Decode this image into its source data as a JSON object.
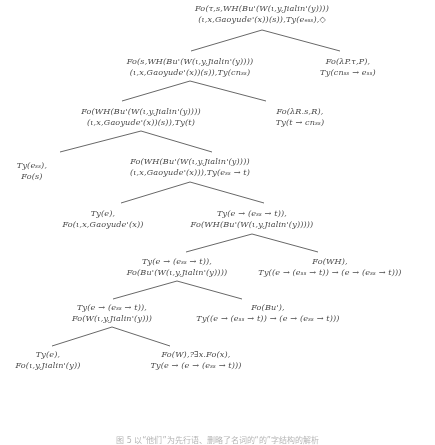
{
  "figure": {
    "type": "derivation-tree",
    "caption": "图 5 以“他们”为先行语、删略了名词的“的”字结构的解析",
    "nodes": [
      {
        "id": "n0",
        "role": "root",
        "line1": "Fo(τ,s,WH(Bu'(W(ι,y,Jialin'(y))))",
        "line2": "(ι,x,Gaoyude'(x))(s)),Ty(eₑₛₛ),◇",
        "x": 262,
        "y": 3,
        "align": "center"
      },
      {
        "id": "n1L",
        "role": "child-left",
        "line1": "Fo(s,WH(Bu'(W(ι,y,Jialin'(y))))",
        "line2": "(ι,x,Gaoyude'(x))(s)),Ty(cnₛₛ)",
        "x": 190,
        "y": 56,
        "align": "center"
      },
      {
        "id": "n1R",
        "role": "child-right",
        "line1": "Fo(λP.τ,P),",
        "line2": "Ty(cnₛₛ → eₛₛ)",
        "x": 348,
        "y": 56,
        "align": "center"
      },
      {
        "id": "n2L",
        "role": "child-left",
        "line1": "Fo(WH(Bu'(W(ι,y,Jialin'(y))))",
        "line2": "(ι,x,Gaoyude'(x))(s)),Ty(t)",
        "x": 141,
        "y": 106,
        "align": "center"
      },
      {
        "id": "n2R",
        "role": "child-right",
        "line1": "Fo(λR.s,R),",
        "line2": "Ty(t → cnₛₛ)",
        "x": 300,
        "y": 106,
        "align": "center"
      },
      {
        "id": "n3L",
        "role": "child-left",
        "line1": "Ty(eₛₛ),",
        "line2": "Fo(s)",
        "x": 32,
        "y": 160,
        "align": "center"
      },
      {
        "id": "n3R",
        "role": "child-right",
        "line1": "Fo(WH(Bu'(W(ι,y,Jialin'(y))))",
        "line2": "(ι,x,Gaoyude'(x))),Ty(eₛₛ → t)",
        "x": 190,
        "y": 156,
        "align": "center"
      },
      {
        "id": "n4L",
        "role": "child-left",
        "line1": "Ty(e),",
        "line2": "Fo(ι,x,Gaoyude'(x))",
        "x": 103,
        "y": 208,
        "align": "center"
      },
      {
        "id": "n4R",
        "role": "child-right",
        "line1": "Ty(e → (eₛₛ → t)),",
        "line2": "Fo(WH(Bu'(W(ι,y,Jialin'(y)))))",
        "x": 252,
        "y": 208,
        "align": "center"
      },
      {
        "id": "n5L",
        "role": "child-left",
        "line1": "Ty(e → (eₛₛ → t)),",
        "line2": "Fo(Bu'(W(ι,y,Jialin'(y))))",
        "x": 177,
        "y": 256,
        "align": "center"
      },
      {
        "id": "n5R",
        "role": "child-right",
        "line1": "Fo(WH),",
        "line2": "Ty((e → (eₛₛ → t)) → (e → (eₛₛ → t)))",
        "x": 330,
        "y": 256,
        "align": "center"
      },
      {
        "id": "n6L",
        "role": "child-left",
        "line1": "Ty(e → (eₛₛ → t)),",
        "line2": "Fo(W(ι,y,Jialin'(y)))",
        "x": 112,
        "y": 302,
        "align": "center"
      },
      {
        "id": "n6R",
        "role": "child-right",
        "line1": "Fo(Bu'),",
        "line2": "Ty((e → (eₛₛ → t)) → (e → (eₛₛ → t)))",
        "x": 268,
        "y": 302,
        "align": "center"
      },
      {
        "id": "n7L",
        "role": "child-left",
        "line1": "Ty(e),",
        "line2": "Fo(ι,y,Jialin'(y))",
        "x": 48,
        "y": 349,
        "align": "center"
      },
      {
        "id": "n7R",
        "role": "child-right",
        "line1": "Fo(W),?∃x.Fo(x),",
        "line2": "Ty(e → (e → (eₛₛ → t)))",
        "x": 196,
        "y": 349,
        "align": "center"
      }
    ],
    "edges": [
      {
        "id": "e0",
        "from": "n0",
        "x1": 262,
        "y1": 30,
        "x2": 191,
        "y2": 51
      },
      {
        "id": "e1",
        "from": "n0",
        "x1": 262,
        "y1": 30,
        "x2": 340,
        "y2": 51
      },
      {
        "id": "e2",
        "from": "n1L",
        "x1": 190,
        "y1": 81,
        "x2": 122,
        "y2": 101
      },
      {
        "id": "e3",
        "from": "n1L",
        "x1": 190,
        "y1": 81,
        "x2": 266,
        "y2": 101
      },
      {
        "id": "e4",
        "from": "n2L",
        "x1": 141,
        "y1": 131,
        "x2": 60,
        "y2": 152
      },
      {
        "id": "e5",
        "from": "n2L",
        "x1": 141,
        "y1": 131,
        "x2": 212,
        "y2": 152
      },
      {
        "id": "e6",
        "from": "n3R",
        "x1": 190,
        "y1": 182,
        "x2": 121,
        "y2": 203
      },
      {
        "id": "e7",
        "from": "n3R",
        "x1": 190,
        "y1": 182,
        "x2": 264,
        "y2": 203
      },
      {
        "id": "e8",
        "from": "n4R",
        "x1": 252,
        "y1": 234,
        "x2": 186,
        "y2": 252
      },
      {
        "id": "e9",
        "from": "n4R",
        "x1": 252,
        "y1": 234,
        "x2": 318,
        "y2": 252
      },
      {
        "id": "e10",
        "from": "n5L",
        "x1": 177,
        "y1": 281,
        "x2": 113,
        "y2": 299
      },
      {
        "id": "e11",
        "from": "n5L",
        "x1": 177,
        "y1": 281,
        "x2": 242,
        "y2": 299
      },
      {
        "id": "e12",
        "from": "n6L",
        "x1": 112,
        "y1": 327,
        "x2": 52,
        "y2": 346
      },
      {
        "id": "e13",
        "from": "n6L",
        "x1": 112,
        "y1": 327,
        "x2": 170,
        "y2": 346
      }
    ],
    "colors": {
      "ink": "#3a3a3a",
      "edge": "#3d3d3d",
      "background": "#ffffff"
    }
  }
}
